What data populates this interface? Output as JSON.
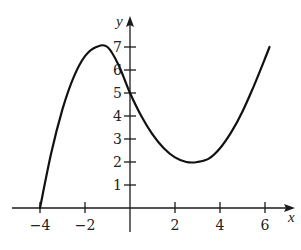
{
  "chart_data": {
    "type": "line",
    "title": "",
    "xlabel": "x",
    "ylabel": "y",
    "xlim": [
      -4.5,
      7
    ],
    "ylim": [
      -0.8,
      8.2
    ],
    "grid": false,
    "legend": null,
    "x_ticks": [
      -4,
      -2,
      2,
      4,
      6
    ],
    "x_tick_labels": [
      "−4",
      "−2",
      "2",
      "4",
      "6"
    ],
    "y_ticks": [
      1,
      2,
      3,
      4,
      5,
      6,
      7
    ],
    "y_tick_labels": [
      "1",
      "2",
      "3",
      "4",
      "5",
      "6",
      "7"
    ],
    "series": [
      {
        "name": "f(x)",
        "x": [
          -4,
          -3.5,
          -3,
          -2.5,
          -2,
          -1.5,
          -1,
          -0.5,
          0,
          0.5,
          1,
          1.5,
          2,
          2.5,
          3,
          3.5,
          4,
          4.5,
          5,
          5.5,
          6,
          6.2
        ],
        "values": [
          0,
          2.4,
          4.3,
          5.7,
          6.6,
          7.0,
          7.0,
          6.2,
          5.0,
          4.0,
          3.2,
          2.6,
          2.2,
          2.0,
          2.0,
          2.15,
          2.6,
          3.3,
          4.2,
          5.3,
          6.5,
          7.0
        ]
      }
    ],
    "annotations": {
      "local_max": [
        -1,
        7
      ],
      "local_min": [
        3,
        2
      ],
      "y_intercept": [
        0,
        5
      ],
      "x_intercept": [
        -4,
        0
      ],
      "right_endpoint": [
        6.2,
        7
      ]
    }
  },
  "labels": {
    "x_axis": "x",
    "y_axis": "y"
  }
}
